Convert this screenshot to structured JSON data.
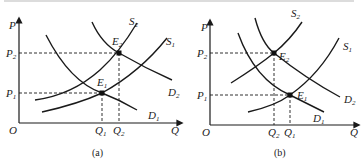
{
  "figure": {
    "top_clipped_text": "",
    "panels": [
      {
        "id": "a",
        "caption": "(a)",
        "axes": {
          "y_label": "P",
          "x_label": "Q",
          "origin_label": "O"
        },
        "price_levels": [
          {
            "label": "P",
            "sub": "2",
            "name": "P2"
          },
          {
            "label": "P",
            "sub": "1",
            "name": "P1"
          }
        ],
        "quantity_levels": [
          {
            "label": "Q",
            "sub": "1",
            "name": "Q1"
          },
          {
            "label": "Q",
            "sub": "2",
            "name": "Q2"
          }
        ],
        "curves": [
          {
            "label": "S",
            "sub": "2",
            "name": "S2"
          },
          {
            "label": "S",
            "sub": "1",
            "name": "S1"
          },
          {
            "label": "D",
            "sub": "2",
            "name": "D2"
          },
          {
            "label": "D",
            "sub": "1",
            "name": "D1"
          }
        ],
        "equilibria": [
          {
            "label": "E",
            "sub": "1",
            "name": "E1",
            "at": "P1,Q1"
          },
          {
            "label": "E",
            "sub": "2",
            "name": "E2",
            "at": "P2,Q2"
          }
        ],
        "description": "Demand and supply both increase; demand shift larger than supply shift: price rises P1 to P2, quantity rises Q1 to Q2"
      },
      {
        "id": "b",
        "caption": "(b)",
        "axes": {
          "y_label": "P",
          "x_label": "Q",
          "origin_label": "O"
        },
        "price_levels": [
          {
            "label": "P",
            "sub": "2",
            "name": "P2"
          },
          {
            "label": "P",
            "sub": "1",
            "name": "P1"
          }
        ],
        "quantity_levels": [
          {
            "label": "Q",
            "sub": "2",
            "name": "Q2"
          },
          {
            "label": "Q",
            "sub": "1",
            "name": "Q1"
          }
        ],
        "curves": [
          {
            "label": "S",
            "sub": "2",
            "name": "S2"
          },
          {
            "label": "S",
            "sub": "1",
            "name": "S1"
          },
          {
            "label": "D",
            "sub": "2",
            "name": "D2"
          },
          {
            "label": "D",
            "sub": "1",
            "name": "D1"
          }
        ],
        "equilibria": [
          {
            "label": "E",
            "sub": "2",
            "name": "E2",
            "at": "P2,Q2"
          },
          {
            "label": "E",
            "sub": "1",
            "name": "E1",
            "at": "P1,Q1"
          }
        ],
        "description": "Demand increases and supply decreases: price rises P1 to P2, quantity falls Q1 to Q2"
      }
    ]
  }
}
